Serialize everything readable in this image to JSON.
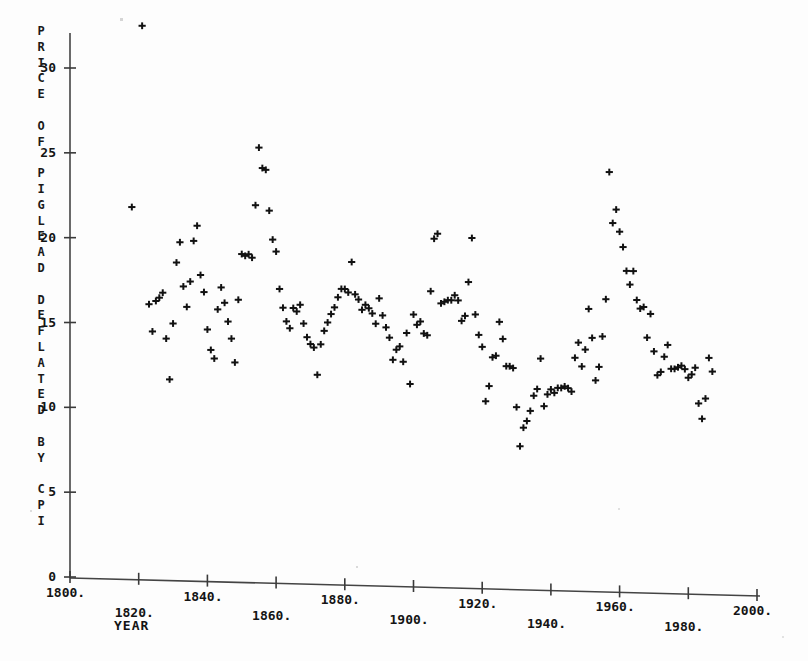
{
  "figure": {
    "background": "#fdfdfd",
    "ink_color": "#111111"
  },
  "axes": {
    "y_title_lines": [
      "P",
      "R",
      "I",
      "C",
      "E",
      "",
      "O",
      "F",
      "",
      "P",
      "I",
      "G",
      "L",
      "E",
      "A",
      "D",
      "",
      "D",
      "E",
      "F",
      "L",
      "A",
      "T",
      "E",
      "D",
      "",
      "B",
      "Y",
      "",
      "C",
      "P",
      "I"
    ],
    "y_title_text": "PRICE OF PIGLEAD DEFLATED BY CPI",
    "x_title": "YEAR",
    "y_ticks": [
      "0",
      "5",
      "10",
      "15",
      "20",
      "25",
      "30"
    ],
    "y_tick_values": [
      0,
      5,
      10,
      15,
      20,
      25,
      30
    ],
    "x_ticks": [
      "1800.",
      "1820.",
      "1840.",
      "1860.",
      "1880.",
      "1900.",
      "1920.",
      "1940.",
      "1960.",
      "1980.",
      "2000."
    ],
    "x_tick_values": [
      1800,
      1820,
      1840,
      1860,
      1880,
      1900,
      1920,
      1940,
      1960,
      1980,
      2000
    ]
  },
  "chart_data": {
    "type": "scatter",
    "title": "",
    "subtitle": "",
    "xlabel": "YEAR",
    "ylabel": "PRICE OF PIGLEAD DEFLATED BY CPI",
    "xlim": [
      1800,
      2000
    ],
    "ylim": [
      0,
      33.5
    ],
    "grid": false,
    "legend": null,
    "marker": "plus",
    "series": [
      {
        "name": "Price of pig lead deflated by CPI",
        "points": [
          [
            1821,
            32.6
          ],
          [
            1818,
            21.9
          ],
          [
            1823,
            16.2
          ],
          [
            1824,
            14.6
          ],
          [
            1825,
            16.4
          ],
          [
            1826,
            16.6
          ],
          [
            1827,
            16.9
          ],
          [
            1828,
            14.2
          ],
          [
            1829,
            11.8
          ],
          [
            1830,
            15.1
          ],
          [
            1831,
            18.7
          ],
          [
            1832,
            19.9
          ],
          [
            1833,
            17.3
          ],
          [
            1834,
            16.1
          ],
          [
            1835,
            17.6
          ],
          [
            1836,
            20.0
          ],
          [
            1837,
            20.9
          ],
          [
            1838,
            18.0
          ],
          [
            1839,
            17.0
          ],
          [
            1840,
            14.8
          ],
          [
            1841,
            13.6
          ],
          [
            1842,
            13.1
          ],
          [
            1843,
            16.0
          ],
          [
            1844,
            17.3
          ],
          [
            1845,
            16.4
          ],
          [
            1846,
            15.3
          ],
          [
            1847,
            14.3
          ],
          [
            1848,
            12.9
          ],
          [
            1849,
            16.6
          ],
          [
            1850,
            19.3
          ],
          [
            1851,
            19.2
          ],
          [
            1852,
            19.3
          ],
          [
            1853,
            19.1
          ],
          [
            1854,
            22.2
          ],
          [
            1855,
            25.6
          ],
          [
            1856,
            24.4
          ],
          [
            1857,
            24.3
          ],
          [
            1858,
            21.9
          ],
          [
            1859,
            20.2
          ],
          [
            1860,
            19.5
          ],
          [
            1861,
            17.3
          ],
          [
            1862,
            16.2
          ],
          [
            1863,
            15.4
          ],
          [
            1864,
            15.0
          ],
          [
            1865,
            16.2
          ],
          [
            1866,
            16.0
          ],
          [
            1867,
            16.4
          ],
          [
            1868,
            15.3
          ],
          [
            1869,
            14.5
          ],
          [
            1870,
            14.1
          ],
          [
            1871,
            13.9
          ],
          [
            1872,
            12.3
          ],
          [
            1873,
            14.1
          ],
          [
            1874,
            14.9
          ],
          [
            1875,
            15.4
          ],
          [
            1876,
            15.9
          ],
          [
            1877,
            16.3
          ],
          [
            1878,
            16.9
          ],
          [
            1879,
            17.4
          ],
          [
            1880,
            17.4
          ],
          [
            1881,
            17.2
          ],
          [
            1882,
            19.0
          ],
          [
            1883,
            17.1
          ],
          [
            1884,
            16.8
          ],
          [
            1885,
            16.2
          ],
          [
            1886,
            16.5
          ],
          [
            1887,
            16.3
          ],
          [
            1888,
            16.0
          ],
          [
            1889,
            15.4
          ],
          [
            1890,
            16.9
          ],
          [
            1891,
            15.9
          ],
          [
            1892,
            15.2
          ],
          [
            1893,
            14.6
          ],
          [
            1894,
            13.3
          ],
          [
            1895,
            13.9
          ],
          [
            1896,
            14.1
          ],
          [
            1897,
            13.2
          ],
          [
            1898,
            14.9
          ],
          [
            1899,
            11.9
          ],
          [
            1900,
            16.0
          ],
          [
            1901,
            15.4
          ],
          [
            1902,
            15.6
          ],
          [
            1903,
            14.9
          ],
          [
            1904,
            14.8
          ],
          [
            1905,
            17.4
          ],
          [
            1906,
            20.5
          ],
          [
            1907,
            20.8
          ],
          [
            1908,
            16.7
          ],
          [
            1909,
            16.8
          ],
          [
            1910,
            16.9
          ],
          [
            1911,
            16.9
          ],
          [
            1912,
            17.2
          ],
          [
            1913,
            16.9
          ],
          [
            1914,
            15.7
          ],
          [
            1915,
            16.0
          ],
          [
            1916,
            18.0
          ],
          [
            1917,
            20.6
          ],
          [
            1918,
            16.1
          ],
          [
            1919,
            14.9
          ],
          [
            1920,
            14.2
          ],
          [
            1921,
            11.0
          ],
          [
            1922,
            11.9
          ],
          [
            1923,
            13.6
          ],
          [
            1924,
            13.7
          ],
          [
            1925,
            15.7
          ],
          [
            1926,
            14.7
          ],
          [
            1927,
            13.1
          ],
          [
            1928,
            13.1
          ],
          [
            1929,
            13.0
          ],
          [
            1930,
            10.7
          ],
          [
            1931,
            8.4
          ],
          [
            1932,
            9.5
          ],
          [
            1933,
            9.9
          ],
          [
            1934,
            10.5
          ],
          [
            1935,
            11.4
          ],
          [
            1936,
            11.8
          ],
          [
            1937,
            13.6
          ],
          [
            1938,
            10.8
          ],
          [
            1939,
            11.5
          ],
          [
            1940,
            11.8
          ],
          [
            1941,
            11.6
          ],
          [
            1942,
            11.9
          ],
          [
            1943,
            11.9
          ],
          [
            1944,
            12.0
          ],
          [
            1945,
            11.9
          ],
          [
            1946,
            11.7
          ],
          [
            1947,
            13.7
          ],
          [
            1948,
            14.6
          ],
          [
            1949,
            13.2
          ],
          [
            1950,
            14.2
          ],
          [
            1951,
            16.6
          ],
          [
            1952,
            14.9
          ],
          [
            1953,
            12.4
          ],
          [
            1954,
            13.2
          ],
          [
            1955,
            15.0
          ],
          [
            1956,
            17.2
          ],
          [
            1957,
            24.7
          ],
          [
            1958,
            21.7
          ],
          [
            1959,
            22.5
          ],
          [
            1960,
            21.2
          ],
          [
            1961,
            20.3
          ],
          [
            1962,
            18.9
          ],
          [
            1963,
            18.1
          ],
          [
            1964,
            18.9
          ],
          [
            1965,
            17.2
          ],
          [
            1966,
            16.7
          ],
          [
            1967,
            16.8
          ],
          [
            1968,
            15.0
          ],
          [
            1969,
            16.4
          ],
          [
            1970,
            14.2
          ],
          [
            1971,
            12.8
          ],
          [
            1972,
            13.0
          ],
          [
            1973,
            13.9
          ],
          [
            1974,
            14.6
          ],
          [
            1975,
            13.2
          ],
          [
            1976,
            13.2
          ],
          [
            1977,
            13.3
          ],
          [
            1978,
            13.4
          ],
          [
            1979,
            13.2
          ],
          [
            1980,
            12.7
          ],
          [
            1981,
            12.9
          ],
          [
            1982,
            13.3
          ],
          [
            1983,
            11.2
          ],
          [
            1984,
            10.3
          ],
          [
            1985,
            11.5
          ],
          [
            1986,
            13.9
          ],
          [
            1987,
            13.1
          ]
        ]
      }
    ]
  }
}
